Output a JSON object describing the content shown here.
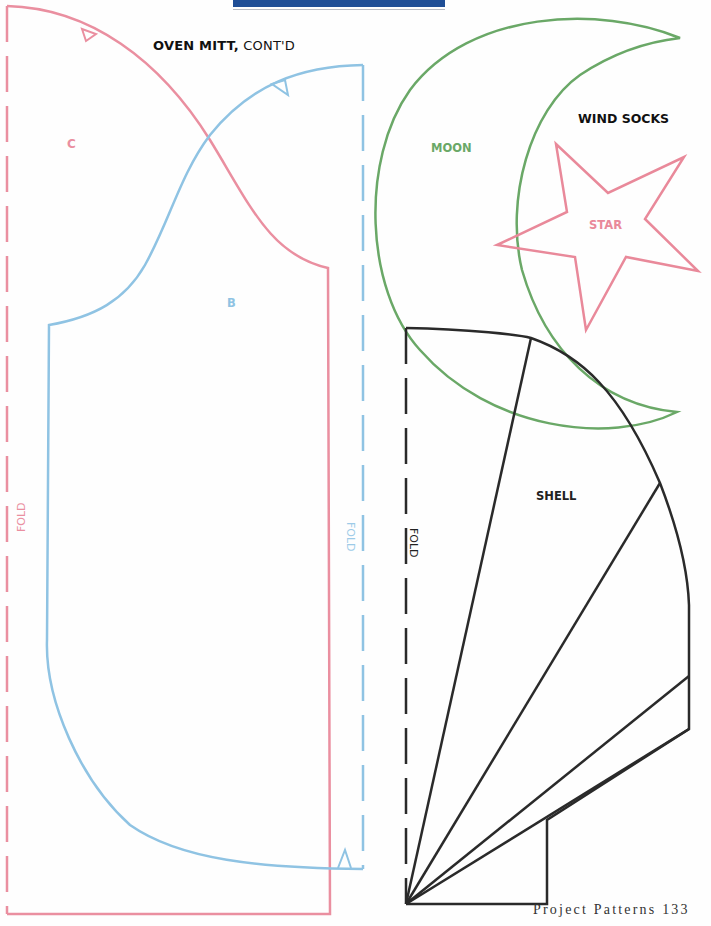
{
  "header": {
    "bar_color": "#1f4e96",
    "title_bold": "OVEN MITT,",
    "title_rest": " CONT'D"
  },
  "section_labels": {
    "wind_socks": "WIND SOCKS"
  },
  "pattern_pieces": [
    {
      "id": "C",
      "label": "C",
      "color": "#ea8fa0",
      "project": "Oven Mitt"
    },
    {
      "id": "B",
      "label": "B",
      "color": "#8fc3e3",
      "project": "Oven Mitt"
    },
    {
      "id": "moon",
      "label": "MOON",
      "color": "#6aa867",
      "project": "Wind Socks"
    },
    {
      "id": "star",
      "label": "STAR",
      "color": "#e9899a",
      "project": "Wind Socks"
    },
    {
      "id": "shell",
      "label": "SHELL",
      "color": "#222222",
      "project": "Wind Socks"
    }
  ],
  "fold_labels": {
    "pink": "FOLD",
    "blue": "FOLD",
    "black": "FOLD"
  },
  "footer": {
    "page_label": "Project Patterns 133"
  }
}
